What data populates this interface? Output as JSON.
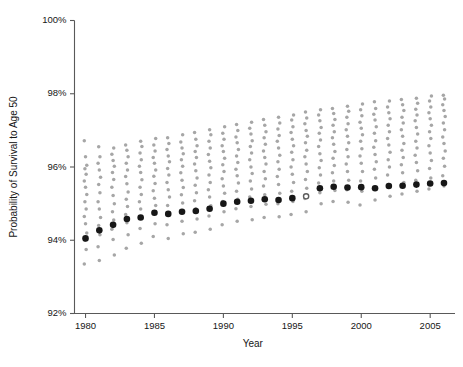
{
  "chart_data": {
    "type": "scatter",
    "title": "",
    "xlabel": "Year",
    "ylabel": "Probability of Survival to Age 50",
    "xlim": [
      1979.2,
      2006.8
    ],
    "ylim": [
      92,
      100
    ],
    "grid": false,
    "legend": "none",
    "y_tick_labels": [
      "92%",
      "94%",
      "96%",
      "98%",
      "100%"
    ],
    "y_ticks": [
      92,
      94,
      96,
      98,
      100
    ],
    "x_tick_labels": [
      "1980",
      "1985",
      "1990",
      "1995",
      "2000",
      "2005"
    ],
    "x_ticks": [
      1980,
      1985,
      1990,
      1995,
      2000,
      2005
    ],
    "series": [
      {
        "name": "overall",
        "marker": "filled-circle",
        "color": "#171717",
        "x": [
          1980,
          1981,
          1982,
          1983,
          1984,
          1985,
          1986,
          1987,
          1988,
          1989,
          1990,
          1991,
          1992,
          1993,
          1994,
          1995,
          1996,
          1997,
          1998,
          1999,
          2000,
          2001,
          2002,
          2003,
          2004,
          2005,
          2006
        ],
        "values": [
          94.05,
          94.27,
          94.42,
          94.58,
          94.62,
          94.75,
          94.72,
          94.78,
          94.8,
          94.86,
          95.0,
          95.05,
          95.08,
          95.12,
          95.1,
          95.15,
          95.2,
          95.42,
          95.46,
          95.44,
          95.45,
          95.42,
          95.48,
          95.49,
          95.52,
          95.55,
          95.56
        ],
        "open_markers": [
          1996
        ]
      },
      {
        "name": "groups",
        "marker": "small-circle",
        "color": "#a6a6a6",
        "columns": [
          {
            "x": 1980,
            "values": [
              93.35,
              93.75,
              94.0,
              94.2,
              94.45,
              94.65,
              94.85,
              95.05,
              95.25,
              95.45,
              95.62,
              95.8,
              95.95,
              96.05,
              96.28,
              96.72
            ]
          },
          {
            "x": 1981,
            "values": [
              93.45,
              93.82,
              94.15,
              94.4,
              94.62,
              94.85,
              95.05,
              95.3,
              95.52,
              95.72,
              95.92,
              96.1,
              96.28,
              96.55
            ]
          },
          {
            "x": 1982,
            "values": [
              93.6,
              94.02,
              94.3,
              94.55,
              94.78,
              95.0,
              95.22,
              95.45,
              95.66,
              95.85,
              96.02,
              96.18,
              96.35,
              96.52
            ]
          },
          {
            "x": 1983,
            "values": [
              93.78,
              94.15,
              94.48,
              94.7,
              94.92,
              95.12,
              95.32,
              95.54,
              95.74,
              95.92,
              96.1,
              96.28,
              96.46,
              96.6
            ]
          },
          {
            "x": 1984,
            "values": [
              93.92,
              94.32,
              94.6,
              94.85,
              95.05,
              95.25,
              95.45,
              95.65,
              95.85,
              96.02,
              96.2,
              96.38,
              96.56,
              96.7
            ]
          },
          {
            "x": 1985,
            "values": [
              94.1,
              94.45,
              94.72,
              94.95,
              95.15,
              95.35,
              95.55,
              95.75,
              95.92,
              96.1,
              96.26,
              96.44,
              96.6,
              96.78
            ]
          },
          {
            "x": 1986,
            "values": [
              94.05,
              94.42,
              94.7,
              94.95,
              95.18,
              95.38,
              95.58,
              95.78,
              95.96,
              96.14,
              96.3,
              96.48,
              96.64,
              96.8
            ]
          },
          {
            "x": 1987,
            "values": [
              94.18,
              94.52,
              94.8,
              95.02,
              95.24,
              95.44,
              95.64,
              95.84,
              96.02,
              96.2,
              96.36,
              96.52,
              96.68,
              96.88
            ]
          },
          {
            "x": 1988,
            "values": [
              94.22,
              94.58,
              94.86,
              95.08,
              95.3,
              95.5,
              95.7,
              95.9,
              96.08,
              96.26,
              96.42,
              96.58,
              96.76,
              96.94
            ]
          },
          {
            "x": 1989,
            "values": [
              94.3,
              94.66,
              94.94,
              95.18,
              95.38,
              95.58,
              95.78,
              95.98,
              96.16,
              96.34,
              96.52,
              96.7,
              96.88,
              97.02
            ]
          },
          {
            "x": 1990,
            "values": [
              94.42,
              94.78,
              95.06,
              95.28,
              95.48,
              95.68,
              95.88,
              96.06,
              96.24,
              96.42,
              96.58,
              96.76,
              96.92,
              97.1
            ]
          },
          {
            "x": 1991,
            "values": [
              94.52,
              94.86,
              95.12,
              95.34,
              95.56,
              95.76,
              95.94,
              96.12,
              96.3,
              96.48,
              96.66,
              96.82,
              97.0,
              97.16
            ]
          },
          {
            "x": 1992,
            "values": [
              94.56,
              94.92,
              95.18,
              95.4,
              95.62,
              95.82,
              96.0,
              96.2,
              96.38,
              96.56,
              96.72,
              96.9,
              97.06,
              97.22
            ]
          },
          {
            "x": 1993,
            "values": [
              94.62,
              94.98,
              95.24,
              95.48,
              95.68,
              95.88,
              96.08,
              96.26,
              96.44,
              96.62,
              96.8,
              96.96,
              97.14,
              97.3
            ]
          },
          {
            "x": 1994,
            "values": [
              94.64,
              95.0,
              95.28,
              95.52,
              95.74,
              95.94,
              96.14,
              96.32,
              96.52,
              96.7,
              96.86,
              97.04,
              97.2,
              97.36
            ]
          },
          {
            "x": 1995,
            "values": [
              94.7,
              95.06,
              95.34,
              95.58,
              95.8,
              96.0,
              96.2,
              96.4,
              96.58,
              96.76,
              96.94,
              97.1,
              97.28,
              97.42
            ]
          },
          {
            "x": 1996,
            "values": [
              94.78,
              95.14,
              95.42,
              95.66,
              95.88,
              96.08,
              96.28,
              96.46,
              96.66,
              96.84,
              97.0,
              97.18,
              97.34,
              97.5
            ]
          },
          {
            "x": 1997,
            "values": [
              95.0,
              95.3,
              95.56,
              95.78,
              95.98,
              96.18,
              96.36,
              96.56,
              96.74,
              96.92,
              97.08,
              97.26,
              97.42,
              97.56
            ]
          },
          {
            "x": 1998,
            "values": [
              95.06,
              95.36,
              95.62,
              95.84,
              96.04,
              96.24,
              96.42,
              96.62,
              96.8,
              96.96,
              97.14,
              97.3,
              97.46,
              97.6
            ]
          },
          {
            "x": 1999,
            "values": [
              95.04,
              95.38,
              95.64,
              95.88,
              96.08,
              96.28,
              96.48,
              96.66,
              96.84,
              97.02,
              97.18,
              97.36,
              97.52,
              97.66
            ]
          },
          {
            "x": 2000,
            "values": [
              94.96,
              95.34,
              95.62,
              95.88,
              96.1,
              96.3,
              96.5,
              96.7,
              96.88,
              97.06,
              97.22,
              97.4,
              97.56,
              97.72
            ]
          },
          {
            "x": 2001,
            "values": [
              95.1,
              95.44,
              95.7,
              95.94,
              96.14,
              96.34,
              96.54,
              96.72,
              96.92,
              97.1,
              97.28,
              97.44,
              97.6,
              97.78
            ]
          },
          {
            "x": 2002,
            "values": [
              95.2,
              95.52,
              95.78,
              96.0,
              96.2,
              96.4,
              96.6,
              96.78,
              96.96,
              97.14,
              97.32,
              97.48,
              97.64,
              97.8
            ]
          },
          {
            "x": 2003,
            "values": [
              95.26,
              95.58,
              95.84,
              96.06,
              96.26,
              96.46,
              96.64,
              96.84,
              97.02,
              97.2,
              97.36,
              97.54,
              97.7,
              97.84
            ]
          },
          {
            "x": 2004,
            "values": [
              95.34,
              95.64,
              95.9,
              96.12,
              96.32,
              96.52,
              96.7,
              96.9,
              97.08,
              97.26,
              97.42,
              97.58,
              97.74,
              97.88
            ]
          },
          {
            "x": 2005,
            "values": [
              95.4,
              95.7,
              95.96,
              96.18,
              96.38,
              96.58,
              96.78,
              96.96,
              97.14,
              97.32,
              97.48,
              97.64,
              97.8,
              97.94
            ]
          },
          {
            "x": 2006,
            "values": [
              95.48,
              95.76,
              96.02,
              96.24,
              96.44,
              96.64,
              96.82,
              97.02,
              97.2,
              97.38,
              97.54,
              97.7,
              97.86,
              97.96
            ]
          }
        ]
      }
    ]
  }
}
